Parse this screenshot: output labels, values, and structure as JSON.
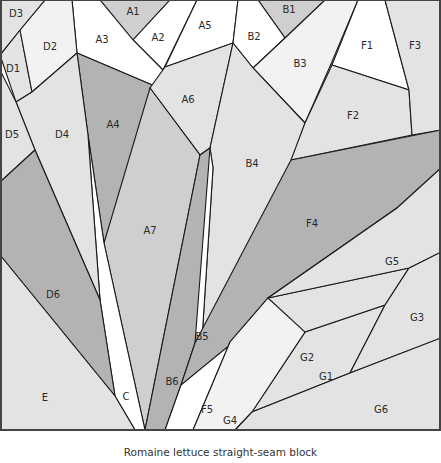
{
  "caption": "Romaine lettuce straight-seam block",
  "colors": {
    "white": "#ffffff",
    "very_light": "#f2f2f2",
    "light": "#e3e3e3",
    "medium": "#cfcfcf",
    "dark": "#b3b3b3",
    "outline": "#1a1a1a"
  },
  "pieces": [
    {
      "id": "A1",
      "fill": "medium",
      "points": "100,0 170,0 133,40",
      "label": {
        "x": 133,
        "y": 12
      }
    },
    {
      "id": "A2",
      "fill": "white",
      "points": "170,0 197,0 163,70 133,40",
      "label": {
        "x": 158,
        "y": 38
      }
    },
    {
      "id": "A3",
      "fill": "white",
      "points": "72,0 100,0 133,40 163,70 157,87 77,53",
      "label": {
        "x": 102,
        "y": 40
      }
    },
    {
      "id": "A4",
      "fill": "dark",
      "points": "77,53 157,87 104,243 88,135",
      "label": {
        "x": 113,
        "y": 125
      }
    },
    {
      "id": "A5",
      "fill": "white",
      "points": "197,0 238,0 233,43 165,67",
      "label": {
        "x": 205,
        "y": 26
      }
    },
    {
      "id": "A6",
      "fill": "light",
      "points": "165,67 233,43 210,148 200,155 150,88",
      "label": {
        "x": 188,
        "y": 100
      }
    },
    {
      "id": "A7",
      "fill": "medium",
      "points": "150,88 200,155 145,430 104,243",
      "label": {
        "x": 150,
        "y": 231
      }
    },
    {
      "id": "B1",
      "fill": "medium",
      "points": "258,0 325,0 285,38",
      "label": {
        "x": 289,
        "y": 10
      }
    },
    {
      "id": "B2",
      "fill": "white",
      "points": "238,0 258,0 285,38 253,68 233,43",
      "label": {
        "x": 254,
        "y": 37
      }
    },
    {
      "id": "B3",
      "fill": "very_light",
      "points": "285,38 325,0 358,0 331,64 305,123 253,68",
      "label": {
        "x": 300,
        "y": 64
      }
    },
    {
      "id": "B4",
      "fill": "light",
      "points": "233,43 253,68 305,123 293,158 200,370 213,168 210,148",
      "label": {
        "x": 252,
        "y": 164
      }
    },
    {
      "id": "B5",
      "fill": "white",
      "points": "213,168 210,148 200,155 195,343 200,370",
      "label": {
        "x": 202,
        "y": 337
      }
    },
    {
      "id": "B6",
      "fill": "dark",
      "points": "200,155 210,148 195,343 181,385 165,430 145,430",
      "label": {
        "x": 172,
        "y": 382
      }
    },
    {
      "id": "C",
      "fill": "white",
      "points": "88,135 104,243 145,430 135,430 115,396 100,300",
      "label": {
        "x": 126,
        "y": 397
      }
    },
    {
      "id": "D1",
      "fill": "light",
      "points": "0,55 20,30 32,92 16,102",
      "label": {
        "x": 13,
        "y": 69
      }
    },
    {
      "id": "D2",
      "fill": "very_light",
      "points": "20,30 45,0 72,0 77,53 32,92",
      "label": {
        "x": 50,
        "y": 47
      }
    },
    {
      "id": "D3",
      "fill": "light",
      "points": "0,0 45,0 20,30 0,55",
      "label": {
        "x": 16,
        "y": 14
      }
    },
    {
      "id": "D4",
      "fill": "light",
      "points": "16,102 32,92 77,53 88,135 100,300 35,150",
      "label": {
        "x": 62,
        "y": 135
      }
    },
    {
      "id": "D5",
      "fill": "light",
      "points": "0,70 16,102 35,150 0,182",
      "label": {
        "x": 12,
        "y": 135
      }
    },
    {
      "id": "D6",
      "fill": "dark",
      "points": "0,182 35,150 100,300 115,396 0,255",
      "label": {
        "x": 53,
        "y": 295
      }
    },
    {
      "id": "E",
      "fill": "light",
      "points": "0,255 115,396 135,430 0,430",
      "label": {
        "x": 45,
        "y": 398
      }
    },
    {
      "id": "F1",
      "fill": "white",
      "points": "358,0 385,0 409,90 332,65",
      "label": {
        "x": 367,
        "y": 46
      }
    },
    {
      "id": "F2",
      "fill": "light",
      "points": "332,65 409,90 412,135 291,160 305,123",
      "label": {
        "x": 353,
        "y": 116
      }
    },
    {
      "id": "F3",
      "fill": "light",
      "points": "385,0 441,0 441,130 412,135 409,90",
      "label": {
        "x": 415,
        "y": 46
      }
    },
    {
      "id": "F4",
      "fill": "dark",
      "points": "291,160 441,130 441,168 397,208 268,298 221,420 181,385 195,343",
      "label": {
        "x": 312,
        "y": 224
      }
    },
    {
      "id": "F5",
      "fill": "white",
      "points": "181,385 397,208 268,298 230,342 193,430 165,430",
      "label": {
        "x": 207,
        "y": 410
      }
    },
    {
      "id": "G1",
      "fill": "light",
      "points": "385,305 350,373 252,412 305,332",
      "label": {
        "x": 326,
        "y": 377
      }
    },
    {
      "id": "G2",
      "fill": "light",
      "points": "268,298 409,268 385,305 305,332 248,413 246,401",
      "label": {
        "x": 307,
        "y": 358
      }
    },
    {
      "id": "G3",
      "fill": "light",
      "points": "409,268 441,252 441,338 350,373 385,305",
      "label": {
        "x": 417,
        "y": 318
      }
    },
    {
      "id": "G4",
      "fill": "very_light",
      "points": "268,298 305,332 252,412 235,430 193,430 230,342",
      "label": {
        "x": 230,
        "y": 421
      }
    },
    {
      "id": "G5",
      "fill": "light",
      "points": "441,168 441,252 409,268 268,298 397,208",
      "label": {
        "x": 392,
        "y": 262
      }
    },
    {
      "id": "G6",
      "fill": "light",
      "points": "441,338 441,430 235,430 252,412 350,373",
      "label": {
        "x": 381,
        "y": 410
      }
    }
  ]
}
